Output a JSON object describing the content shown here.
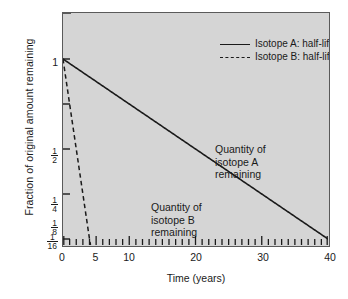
{
  "chart_data": {
    "type": "line",
    "title": "",
    "xlabel": "Time (years)",
    "ylabel": "Fraction of original amount remaining",
    "xlim": [
      0,
      40
    ],
    "ylim_fraction": [
      0.0625,
      1
    ],
    "yscale": "log2",
    "grid": false,
    "legend_position": "top-right",
    "x_ticks": [
      {
        "value": 0,
        "label": "0"
      },
      {
        "value": 5,
        "label": "5"
      },
      {
        "value": 10,
        "label": "10"
      },
      {
        "value": 20,
        "label": "20"
      },
      {
        "value": 30,
        "label": "30"
      },
      {
        "value": 40,
        "label": "40"
      }
    ],
    "x_minor_ticks": [
      1,
      2,
      3,
      4,
      6,
      7,
      8,
      9,
      11,
      12,
      13,
      14,
      15,
      16,
      17,
      18,
      19,
      21,
      22,
      23,
      24,
      25,
      26,
      27,
      28,
      29,
      31,
      32,
      33,
      34,
      35,
      36,
      37,
      38,
      39
    ],
    "y_ticks": [
      {
        "value": 1,
        "label": "1",
        "numerator": "",
        "denominator": ""
      },
      {
        "value": 0.5,
        "label": "1/2",
        "numerator": "1",
        "denominator": "2"
      },
      {
        "value": 0.25,
        "label": "1/4",
        "numerator": "1",
        "denominator": "4"
      },
      {
        "value": 0.125,
        "label": "1/8",
        "numerator": "1",
        "denominator": "8"
      },
      {
        "value": 0.0625,
        "label": "1/16",
        "numerator": "1",
        "denominator": "16"
      }
    ],
    "series": [
      {
        "name": "Isotope A: half-life 10 years",
        "style": "solid",
        "half_life": 10,
        "x": [
          0,
          1,
          2,
          3,
          4,
          5,
          6,
          7,
          8,
          9,
          10,
          12,
          14,
          16,
          18,
          20,
          22,
          24,
          26,
          28,
          30,
          32,
          34,
          36,
          38,
          40
        ],
        "y": [
          1.0,
          0.933,
          0.871,
          0.812,
          0.758,
          0.707,
          0.66,
          0.616,
          0.574,
          0.536,
          0.5,
          0.435,
          0.379,
          0.33,
          0.287,
          0.25,
          0.218,
          0.189,
          0.165,
          0.144,
          0.125,
          0.109,
          0.095,
          0.082,
          0.072,
          0.0625
        ]
      },
      {
        "name": "Isotope B: half-life 1 year",
        "style": "dashed",
        "half_life": 1,
        "x": [
          0,
          0.5,
          1,
          1.5,
          2,
          2.5,
          3,
          3.5,
          4,
          5,
          6,
          8,
          10,
          12,
          15
        ],
        "y": [
          1.0,
          0.707,
          0.5,
          0.354,
          0.25,
          0.177,
          0.125,
          0.088,
          0.0625,
          0.031,
          0.0156,
          0.0039,
          0.001,
          0.00024,
          3e-05
        ]
      }
    ],
    "annotations": [
      {
        "id": "isotope-a",
        "lines": [
          "Quantity of",
          "isotope A",
          "remaining"
        ]
      },
      {
        "id": "isotope-b",
        "lines": [
          "Quantity of",
          "isotope B",
          "remaining"
        ]
      }
    ],
    "colors": {
      "plot_background": "#d5d5d5",
      "page_background": "#ffffff",
      "line": "#1a1a1a",
      "axis": "#5a5a5a"
    }
  }
}
